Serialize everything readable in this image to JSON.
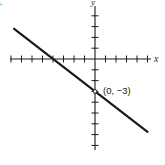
{
  "figure": {
    "part_label": "a.",
    "x_axis_label": "x",
    "y_axis_label": "y",
    "point_label": "(0, −3)"
  },
  "colors": {
    "ink": "#1a1a1a",
    "background": "#ffffff"
  },
  "chart_data": {
    "type": "line",
    "title": "",
    "xlabel": "x",
    "ylabel": "y",
    "grid": false,
    "xlim": [
      -8,
      5
    ],
    "ylim": [
      -8,
      4
    ],
    "x_ticks": [
      -8,
      -7,
      -6,
      -5,
      -4,
      -3,
      -2,
      -1,
      1,
      2,
      3,
      4,
      5
    ],
    "y_ticks": [
      -8,
      -7,
      -6,
      -5,
      -4,
      -3,
      -2,
      -1,
      1,
      2,
      3,
      4
    ],
    "tick_labels_shown": false,
    "series": [
      {
        "name": "line",
        "equation": "y = -3/4 x - 3",
        "slope": -0.75,
        "y_intercept": -3,
        "x_intercept": -4,
        "x": [
          -7.7,
          5.0
        ],
        "y": [
          2.8,
          -6.75
        ]
      }
    ],
    "annotations": [
      {
        "x": 0,
        "y": -3,
        "text": "(0, −3)",
        "marker": "open-circle"
      }
    ]
  }
}
